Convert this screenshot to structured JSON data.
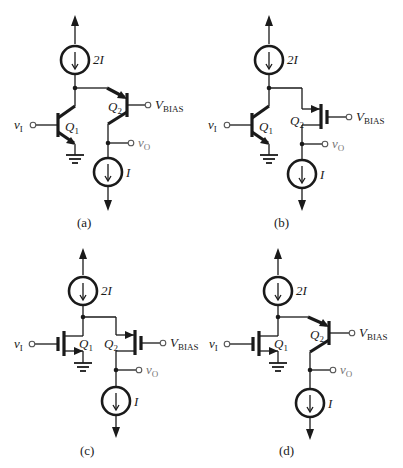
{
  "figure": {
    "panels": [
      {
        "id": "a",
        "caption": "(a)",
        "q1_type": "npn-bjt",
        "q2_type": "pnp-bjt",
        "labels": {
          "top_source": "2I",
          "bottom_source": "I",
          "q1": "Q",
          "q1_sub": "1",
          "q2": "Q",
          "q2_sub": "2",
          "input": "v",
          "input_sub": "I",
          "bias": "V",
          "bias_sub": "BIAS",
          "output": "v",
          "output_sub": "O"
        }
      },
      {
        "id": "b",
        "caption": "(b)",
        "q1_type": "npn-bjt",
        "q2_type": "pmos",
        "labels": {
          "top_source": "2I",
          "bottom_source": "I",
          "q1": "Q",
          "q1_sub": "1",
          "q2": "Q",
          "q2_sub": "2",
          "input": "v",
          "input_sub": "I",
          "bias": "V",
          "bias_sub": "BIAS",
          "output": "v",
          "output_sub": "O"
        }
      },
      {
        "id": "c",
        "caption": "(c)",
        "q1_type": "nmos",
        "q2_type": "pmos",
        "labels": {
          "top_source": "2I",
          "bottom_source": "I",
          "q1": "Q",
          "q1_sub": "1",
          "q2": "Q",
          "q2_sub": "2",
          "input": "v",
          "input_sub": "I",
          "bias": "V",
          "bias_sub": "BIAS",
          "output": "v",
          "output_sub": "O"
        }
      },
      {
        "id": "d",
        "caption": "(d)",
        "q1_type": "nmos",
        "q2_type": "pnp-bjt",
        "labels": {
          "top_source": "2I",
          "bottom_source": "I",
          "q1": "Q",
          "q1_sub": "1",
          "q2": "Q",
          "q2_sub": "2",
          "input": "v",
          "input_sub": "I",
          "bias": "V",
          "bias_sub": "BIAS",
          "output": "v",
          "output_sub": "O"
        }
      }
    ],
    "colors": {
      "wire": "#1a1a1a",
      "output_label": "#777777",
      "background": "#ffffff"
    }
  }
}
